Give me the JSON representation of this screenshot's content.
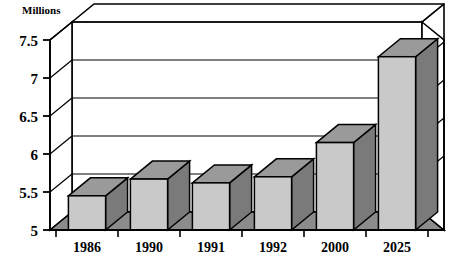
{
  "chart_data": {
    "type": "bar",
    "title": "",
    "ylabel": "Millions",
    "xlabel": "",
    "categories": [
      "1986",
      "1990",
      "1991",
      "1992",
      "2000",
      "2025"
    ],
    "values": [
      5.45,
      5.67,
      5.62,
      5.7,
      6.15,
      7.28
    ],
    "ylim": [
      5,
      7.5
    ],
    "ytick_labels": [
      "5",
      "5.5",
      "6",
      "6.5",
      "7",
      "7.5"
    ],
    "ytick_values": [
      5,
      5.5,
      6,
      6.5,
      7,
      7.5
    ],
    "grid": true,
    "legend": "none",
    "style": "3d-isometric-bars",
    "series": [
      {
        "name": "Millions",
        "values": [
          5.45,
          5.67,
          5.62,
          5.7,
          6.15,
          7.28
        ]
      }
    ]
  },
  "colors": {
    "bar_front": "#c9c9c9",
    "bar_top": "#9a9a9a",
    "bar_side": "#7a7a7a",
    "floor": "#8c8c8c",
    "wall": "#ffffff",
    "outline": "#000000",
    "background": "#ffffff"
  }
}
